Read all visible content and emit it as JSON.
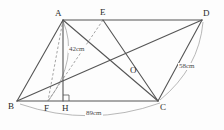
{
  "figure": {
    "type": "geometry-diagram",
    "shape": "parallelogram-with-diagonals",
    "colors": {
      "solid_stroke": "#555555",
      "dashed_stroke": "#9a9a9a",
      "arc_stroke": "#9a9a9a",
      "label_text": "#2b2b2b",
      "measure_text": "#4a4a4a",
      "background": "#fdfdfd"
    },
    "vertices": [
      {
        "name": "A",
        "label": "A",
        "x": 63,
        "y": 20,
        "lx": 55,
        "ly": 9
      },
      {
        "name": "E",
        "label": "E",
        "x": 103,
        "y": 20,
        "lx": 100,
        "ly": 8
      },
      {
        "name": "D",
        "label": "D",
        "x": 202,
        "y": 20,
        "lx": 203,
        "ly": 9
      },
      {
        "name": "O",
        "label": "O",
        "x": 134,
        "y": 66,
        "lx": 130,
        "ly": 66
      },
      {
        "name": "B",
        "label": "B",
        "x": 17,
        "y": 101,
        "lx": 8,
        "ly": 102
      },
      {
        "name": "F",
        "label": "F",
        "x": 48,
        "y": 101,
        "lx": 44,
        "ly": 104
      },
      {
        "name": "H",
        "label": "H",
        "x": 63,
        "y": 101,
        "lx": 62,
        "ly": 104
      },
      {
        "name": "C",
        "label": "C",
        "x": 158,
        "y": 101,
        "lx": 160,
        "ly": 103
      }
    ],
    "solid_edges": [
      {
        "name": "edge-AD",
        "x1": 63,
        "y1": 20,
        "x2": 202,
        "y2": 20
      },
      {
        "name": "edge-BC",
        "x1": 17,
        "y1": 101,
        "x2": 158,
        "y2": 101
      },
      {
        "name": "edge-AB",
        "x1": 63,
        "y1": 20,
        "x2": 17,
        "y2": 101
      },
      {
        "name": "edge-DC",
        "x1": 202,
        "y1": 20,
        "x2": 158,
        "y2": 101
      },
      {
        "name": "diagonal-AC",
        "x1": 63,
        "y1": 20,
        "x2": 158,
        "y2": 101
      },
      {
        "name": "diagonal-BD",
        "x1": 17,
        "y1": 101,
        "x2": 202,
        "y2": 20
      },
      {
        "name": "segment-EC",
        "x1": 103,
        "y1": 20,
        "x2": 158,
        "y2": 101
      },
      {
        "name": "altitude-AH",
        "x1": 63,
        "y1": 20,
        "x2": 63,
        "y2": 101
      }
    ],
    "dashed_edges": [
      {
        "name": "segment-EF",
        "x1": 103,
        "y1": 20,
        "x2": 48,
        "y2": 101
      },
      {
        "name": "segment-AF",
        "x1": 63,
        "y1": 20,
        "x2": 48,
        "y2": 101
      }
    ],
    "arcs": [
      {
        "name": "arc-AF",
        "d": "M 63 21 Q 79 58 49 100"
      },
      {
        "name": "arc-DC",
        "d": "M 203 22 Q 199 68 160 100"
      },
      {
        "name": "arc-BC",
        "d": "M 20 104 Q 90 128 160 103"
      }
    ],
    "right_angle": {
      "name": "right-angle-marker-H",
      "d": "M 63 95 L 69 95 L 69 101"
    },
    "measurements": [
      {
        "name": "measure-42cm",
        "label": "42cm",
        "x": 68,
        "y": 46
      },
      {
        "name": "measure-58cm",
        "label": "58cm",
        "x": 178,
        "y": 63
      },
      {
        "name": "measure-89cm",
        "label": "89cm",
        "x": 85,
        "y": 110
      }
    ]
  }
}
